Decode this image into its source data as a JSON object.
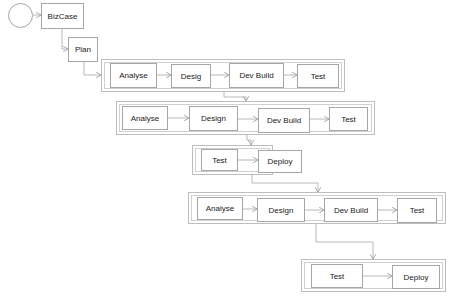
{
  "diagram": {
    "title": "",
    "colors": {
      "node_border": "#a6a6a6",
      "container_border": "#bdbdbd",
      "connector": "#a6a6a6",
      "text": "#1a1a1a",
      "background": "#ffffff"
    },
    "start": {
      "label": "",
      "shape": "circle"
    },
    "nodes": {
      "bizcase": "BizCase",
      "plan": "Plan"
    },
    "stages": [
      {
        "name": "iteration-1",
        "steps": [
          "Analyse",
          "Desig",
          "Dev Build",
          "Test"
        ]
      },
      {
        "name": "iteration-2",
        "steps": [
          "Analyse",
          "Design",
          "Dev Build",
          "Test"
        ]
      },
      {
        "name": "release-1",
        "steps": [
          "Test",
          "Deploy"
        ]
      },
      {
        "name": "iteration-3",
        "steps": [
          "Analyse",
          "Design",
          "Dev Build",
          "Test"
        ]
      },
      {
        "name": "release-2",
        "steps": [
          "Test",
          "Deploy"
        ]
      }
    ]
  }
}
